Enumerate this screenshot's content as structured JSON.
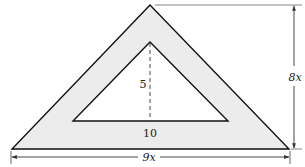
{
  "diagram": {
    "colors": {
      "fill": "#ececec",
      "stroke": "#111111",
      "dimension": "#333333",
      "background": "#ffffff"
    },
    "outer_triangle": {
      "points": "150,5 12,149 289,149",
      "height_label": "8x",
      "base_label": "9x"
    },
    "inner_triangle": {
      "points": "150,42 73,121 228,121",
      "height_label": "5",
      "base_label": "10"
    },
    "labels": {
      "inner_height": "5",
      "inner_base": "10",
      "outer_height": "8x",
      "outer_base": "9x"
    }
  }
}
